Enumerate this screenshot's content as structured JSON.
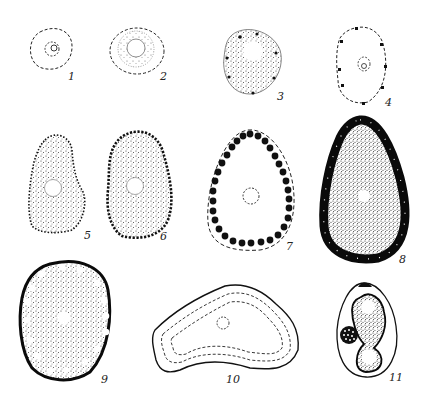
{
  "figure": {
    "ink_color": "#1a1a1a",
    "stipple_color": "#444444",
    "background": "#ffffff",
    "panels": [
      {
        "id": 1,
        "label": "1",
        "description": "small cell, dashed outline, small dashed nucleus"
      },
      {
        "id": 2,
        "label": "2",
        "description": "dashed outline, radiating stippled cytoplasm around clear nucleus"
      },
      {
        "id": 3,
        "label": "3",
        "description": "stippled cell with clear nucleus and few peripheral dots"
      },
      {
        "id": 4,
        "label": "4",
        "description": "dashed oval outline with scattered peripheral dots, small nucleus"
      },
      {
        "id": 5,
        "label": "5",
        "description": "irregular stippled cell with dotted periphery, clear nucleus"
      },
      {
        "id": 6,
        "label": "6",
        "description": "oval stippled cell with row of peripheral granules"
      },
      {
        "id": 7,
        "label": "7",
        "description": "egg-shaped dashed outline with ring of large black granules, dashed nucleus"
      },
      {
        "id": 8,
        "label": "8",
        "description": "egg-shaped dense stippled cell with black granule ring"
      },
      {
        "id": 9,
        "label": "9",
        "description": "round stippled cell, thick black wall, clear peripheral vacuoles"
      },
      {
        "id": 10,
        "label": "10",
        "description": "irregular kidney-shaped cell with double dashed inner contours and dashed nucleus"
      },
      {
        "id": 11,
        "label": "11",
        "description": "ovoid capsule with cap, dark S-shaped body with two clear vacuoles and a dotted sphere"
      }
    ]
  }
}
